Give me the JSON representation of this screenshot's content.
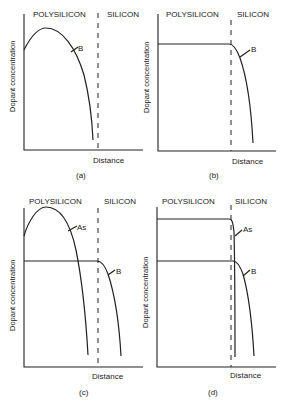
{
  "panels": [
    {
      "id": "a",
      "caption": "(a)",
      "left_region": "POLYSILICON",
      "right_region": "SILICON",
      "ylabel": "Dopant concentration",
      "xlabel": "Distance",
      "curves": [
        {
          "label": "B",
          "shape": "peaked in polysilicon, falls to zero before interface"
        }
      ]
    },
    {
      "id": "b",
      "caption": "(b)",
      "left_region": "POLYSILICON",
      "right_region": "SILICON",
      "ylabel": "Dopant concentration",
      "xlabel": "Distance",
      "curves": [
        {
          "label": "B",
          "shape": "flat in polysilicon, diffuses into silicon"
        }
      ]
    },
    {
      "id": "c",
      "caption": "(c)",
      "left_region": "POLYSILICON",
      "right_region": "SILICON",
      "ylabel": "Dopant concentration",
      "xlabel": "Distance",
      "curves": [
        {
          "label": "As",
          "shape": "peaked in polysilicon, falls to zero before interface"
        },
        {
          "label": "B",
          "shape": "flat in polysilicon, diffuses into silicon"
        }
      ]
    },
    {
      "id": "d",
      "caption": "(d)",
      "left_region": "POLYSILICON",
      "right_region": "SILICON",
      "ylabel": "Dopant concentration",
      "xlabel": "Distance",
      "curves": [
        {
          "label": "As",
          "shape": "high flat in polysilicon, shallow drop just past interface"
        },
        {
          "label": "B",
          "shape": "lower flat, deeper diffusion into silicon"
        }
      ]
    }
  ]
}
